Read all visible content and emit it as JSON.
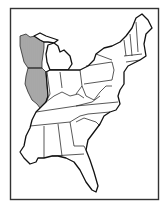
{
  "map": {
    "title": "",
    "region": "Eastern United States",
    "highlighted_states": [
      "Wisconsin",
      "Illinois"
    ],
    "highlight_style": "vertical-hatch",
    "states_shown": [
      "Maine",
      "New Hampshire",
      "Vermont",
      "Massachusetts",
      "Rhode Island",
      "Connecticut",
      "New York",
      "New Jersey",
      "Pennsylvania",
      "Delaware",
      "Maryland",
      "West Virginia",
      "Virginia",
      "Ohio",
      "Michigan",
      "Indiana",
      "Illinois",
      "Wisconsin",
      "Kentucky",
      "Tennessee",
      "North Carolina",
      "South Carolina",
      "Georgia",
      "Florida",
      "Alabama",
      "Mississippi"
    ],
    "colors": {
      "line": "#111111",
      "frame": "#333333",
      "background": "#ffffff",
      "hatch": "#222222"
    }
  }
}
